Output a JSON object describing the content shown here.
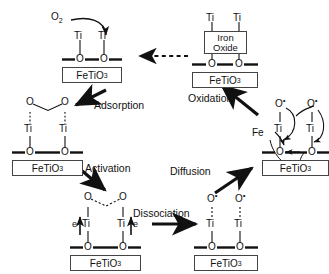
{
  "diagram": {
    "substrate_label_plain": "FeTiO3",
    "substrate_label_parts": {
      "pre": "FeTiO",
      "sub": "3"
    },
    "oxygen_molecule": {
      "pre": "O",
      "sub": "2"
    },
    "atoms": {
      "ti": "Ti",
      "o": "O",
      "fe": "Fe",
      "e": "e",
      "o_radical_pre": "O",
      "o_radical_sup": "•"
    },
    "oxide_box": {
      "line1": "Iron",
      "line2": "Oxide"
    },
    "steps": [
      {
        "id": "adsorption",
        "label": "Adsorption"
      },
      {
        "id": "activation",
        "label": "Activation"
      },
      {
        "id": "dissociation",
        "label": "Dissociation"
      },
      {
        "id": "diffusion",
        "label": "Diffusion"
      },
      {
        "id": "oxidation",
        "label": "Oxidation"
      }
    ],
    "nodes": [
      {
        "id": "clean-surface",
        "position": "top-left",
        "description": "Clean FeTiO3 surface with two Ti sites bonded to surface O"
      },
      {
        "id": "iron-oxide-surface",
        "position": "top-right",
        "description": "FeTiO3 surface capped by segregated Iron Oxide between Ti sites"
      },
      {
        "id": "adsorbed-o2",
        "position": "middle-left",
        "description": "Molecular O2 adsorbed across two Ti sites"
      },
      {
        "id": "activated-o2",
        "position": "bottom-left",
        "description": "Activated O2 with electron transfer from two Ti sites"
      },
      {
        "id": "dissociated-o",
        "position": "bottom-right",
        "description": "Two dissociated O radicals on Ti sites"
      },
      {
        "id": "fe-diffusion",
        "position": "middle-right",
        "description": "Fe diffusion to surface O radicals forming iron oxide"
      }
    ],
    "arrows": {
      "regeneration": {
        "style": "dashed",
        "direction": "right-to-left",
        "from": "iron-oxide-surface",
        "to": "clean-surface"
      }
    },
    "colors": {
      "line": "#111111",
      "box_border": "#444444",
      "background": "#ffffff"
    }
  }
}
